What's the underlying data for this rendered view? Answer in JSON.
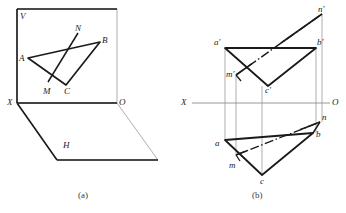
{
  "figure": {
    "colors": {
      "heavy_line": "#1a1a1a",
      "light_line": "#8c8c8c",
      "axis_line": "#8c8c8c",
      "hidden_line": "#6f6f6f",
      "text": "#1c1c1c",
      "background": "#ffffff"
    }
  },
  "panel_a": {
    "caption": "(a)",
    "plane_v_label": "V",
    "plane_h_label": "H",
    "origin_label": "O",
    "x_axis_label": "X",
    "vertices": {
      "A": "A",
      "B": "B",
      "C": "C",
      "M": "M",
      "N": "N"
    },
    "geometry": {
      "v_plane_rect": {
        "x": 17,
        "y": 9,
        "w": 100,
        "h": 94
      },
      "h_plane_points": "17,103 117,103 158,160 57,160",
      "triangle_points": "28,58 100,42 66,85",
      "line_mn": {
        "x1": 48,
        "y1": 82,
        "x2": 78,
        "y2": 33
      }
    }
  },
  "panel_b": {
    "caption": "(b)",
    "x_axis_label": "X",
    "origin_label": "O",
    "projection_labels": {
      "a_front": "a'",
      "b_front": "b'",
      "c_front": "c'",
      "m_front": "m'",
      "n_front": "n'",
      "a_top": "a",
      "b_top": "b",
      "c_top": "c",
      "m_top": "m",
      "n_top": "n"
    },
    "geometry": {
      "axis_y": 103,
      "axis_x1": 192,
      "axis_x2": 330,
      "front_triangle_points": "225,48 316,48 268,86",
      "front_line_mn": {
        "x1": 236,
        "y1": 75,
        "x2": 322,
        "y2": 14
      },
      "top_triangle_points": "225,140 313,133 262,175",
      "top_line_mn": {
        "x1": 236,
        "y1": 155,
        "x2": 320,
        "y2": 122
      },
      "projectors_x": [
        225,
        236,
        262,
        316,
        320
      ]
    }
  }
}
